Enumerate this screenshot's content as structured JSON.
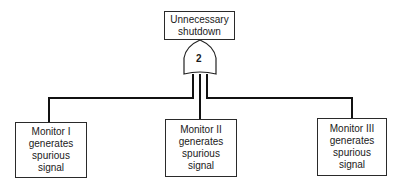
{
  "diagram": {
    "type": "fault-tree",
    "top_event": {
      "lines": [
        "Unnecessary",
        "shutdown"
      ]
    },
    "gate": {
      "type": "voting-OR",
      "label": "2"
    },
    "inputs": [
      {
        "lines": [
          "Monitor I",
          "generates",
          "spurious",
          "signal"
        ]
      },
      {
        "lines": [
          "Monitor II",
          "generates",
          "spurious",
          "signal"
        ]
      },
      {
        "lines": [
          "Monitor III",
          "generates",
          "spurious",
          "signal"
        ]
      }
    ]
  }
}
